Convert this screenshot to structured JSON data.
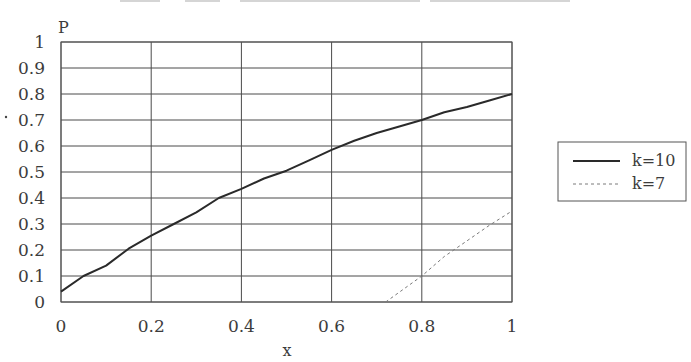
{
  "chart_data": {
    "type": "line",
    "title": "",
    "xlabel": "x",
    "ylabel": "P",
    "xlim": [
      0,
      1
    ],
    "ylim": [
      0,
      1
    ],
    "grid": true,
    "x_ticks": [
      "0",
      "0.2",
      "0.4",
      "0.6",
      "0.8",
      "1"
    ],
    "y_ticks": [
      "0",
      "0.1",
      "0.2",
      "0.3",
      "0.4",
      "0.5",
      "0.6",
      "0.7",
      "0.8",
      "0.9",
      "1"
    ],
    "legend_position": "right",
    "series": [
      {
        "name": "k=10",
        "style": "solid",
        "color": "#2a2a2a",
        "x": [
          0,
          0.05,
          0.1,
          0.15,
          0.2,
          0.25,
          0.3,
          0.35,
          0.4,
          0.45,
          0.5,
          0.55,
          0.6,
          0.65,
          0.7,
          0.75,
          0.8,
          0.85,
          0.9,
          0.95,
          1.0
        ],
        "y": [
          0.04,
          0.1,
          0.14,
          0.205,
          0.255,
          0.3,
          0.345,
          0.4,
          0.435,
          0.475,
          0.505,
          0.545,
          0.585,
          0.62,
          0.65,
          0.675,
          0.7,
          0.73,
          0.75,
          0.775,
          0.8
        ]
      },
      {
        "name": "k=7",
        "style": "dashed",
        "color": "#7a7a7a",
        "x": [
          0.72,
          0.8,
          0.85,
          0.9,
          0.95,
          1.0
        ],
        "y": [
          0.0,
          0.1,
          0.175,
          0.235,
          0.295,
          0.35
        ]
      }
    ]
  }
}
